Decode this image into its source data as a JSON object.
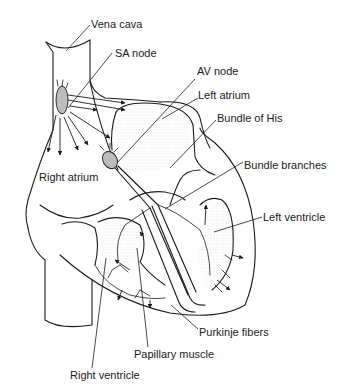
{
  "diagram": {
    "type": "anatomical-illustration",
    "line_color": "#1a1a1a",
    "background": "#ffffff",
    "labels": {
      "vena_cava": "Vena cava",
      "sa_node": "SA node",
      "av_node": "AV node",
      "left_atrium": "Left atrium",
      "bundle_of_his": "Bundle of His",
      "bundle_branches": "Bundle branches",
      "right_atrium": "Right atrium",
      "left_ventricle": "Left ventricle",
      "purkinje_fibers": "Purkinje fibers",
      "papillary_muscle": "Papillary muscle",
      "right_ventricle": "Right ventricle"
    }
  }
}
